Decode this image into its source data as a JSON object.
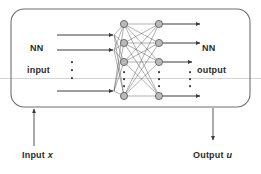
{
  "figure": {
    "kind": "neural-network-block-diagram",
    "title": "",
    "background_color": "#ffffff",
    "stroke_color": "#3a3a3a",
    "node_fill_color": "#b9b9b9",
    "node_stroke_color": "#555555",
    "box_stroke_color": "#6e6e6e",
    "text_color": "#2b2b2b",
    "scan_line_color": "#c9c9c9"
  },
  "labels": {
    "nn_input_line1": "NN",
    "nn_input_line2": "input",
    "nn_output_line1": "NN",
    "nn_output_line2": "output",
    "input_signal_prefix": "Input",
    "input_signal_symbol": "x",
    "output_signal_prefix": "Output",
    "output_signal_symbol": "u"
  },
  "block": {
    "x": 11,
    "y": 9,
    "width": 239,
    "height": 98,
    "corner_radius": 13
  },
  "network": {
    "input_arrows": [
      {
        "x1": 57,
        "x2": 114,
        "y": 35
      },
      {
        "x1": 57,
        "x2": 114,
        "y": 50
      },
      {
        "x1": 57,
        "x2": 114,
        "y": 91
      }
    ],
    "input_vertical_dots": [
      {
        "x": 72,
        "y": 62
      },
      {
        "x": 72,
        "y": 70
      },
      {
        "x": 72,
        "y": 78
      }
    ],
    "hidden_layer_1": {
      "x": 124,
      "nodes_y": [
        24,
        43,
        62,
        96
      ],
      "dots_y": [
        72,
        79,
        86
      ]
    },
    "hidden_layer_2": {
      "x": 159,
      "nodes_y": [
        24,
        43,
        62,
        96
      ],
      "dots_y": [
        72,
        79,
        86
      ]
    },
    "output_arrows": [
      {
        "x1": 163,
        "x2": 200,
        "y": 24
      },
      {
        "x1": 163,
        "x2": 200,
        "y": 43
      },
      {
        "x1": 163,
        "x2": 200,
        "y": 62
      },
      {
        "x1": 163,
        "x2": 200,
        "y": 96
      }
    ],
    "output_vertical_dots": [
      {
        "x": 190,
        "y": 72
      },
      {
        "x": 190,
        "y": 79
      },
      {
        "x": 190,
        "y": 86
      }
    ],
    "node_radius": 3.6
  },
  "signal_arrows": {
    "input_arrow": {
      "x": 34,
      "y_from": 146,
      "y_to": 108,
      "direction": "up"
    },
    "output_arrow": {
      "x": 213,
      "y_from": 108,
      "y_to": 141,
      "direction": "down"
    }
  },
  "artifacts": {
    "scan_line_y": 78
  }
}
